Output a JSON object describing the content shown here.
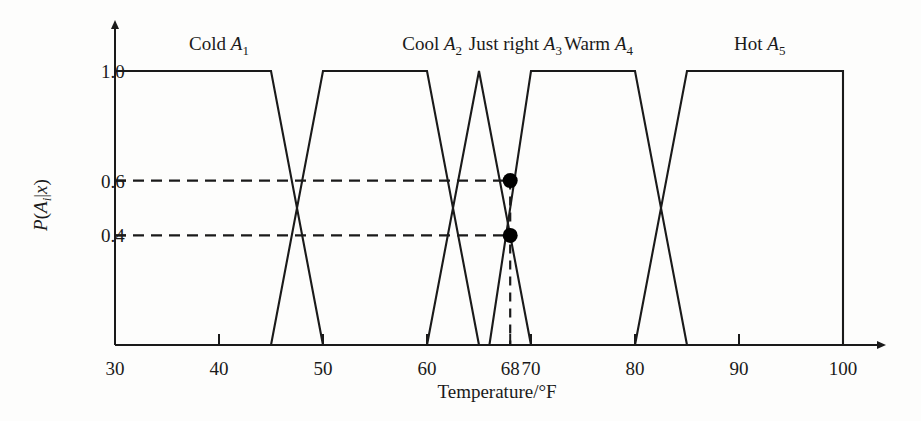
{
  "chart_data": {
    "type": "line",
    "title": "",
    "xlabel": "Temperature/°F",
    "ylabel": "P(A_i|x)",
    "xlim": [
      30,
      100
    ],
    "ylim": [
      0,
      1.0
    ],
    "grid": false,
    "legend_position": "above-curves",
    "x_ticks": [
      {
        "value": 30,
        "label": "30"
      },
      {
        "value": 40,
        "label": "40"
      },
      {
        "value": 50,
        "label": "50"
      },
      {
        "value": 60,
        "label": "60"
      },
      {
        "value": 68,
        "label": "68"
      },
      {
        "value": 70,
        "label": "70"
      },
      {
        "value": 80,
        "label": "80"
      },
      {
        "value": 90,
        "label": "90"
      },
      {
        "value": 100,
        "label": "100"
      }
    ],
    "y_ticks": [
      {
        "value": 1.0,
        "label": "1.0"
      },
      {
        "value": 0.6,
        "label": "0.6"
      },
      {
        "value": 0.4,
        "label": "0.4"
      }
    ],
    "series": [
      {
        "name": "Cold",
        "symbol": "A",
        "subscript": "1",
        "label_text": "Cold",
        "label_x": 40,
        "points": [
          [
            30,
            1.0
          ],
          [
            45,
            1.0
          ],
          [
            50,
            0.0
          ]
        ]
      },
      {
        "name": "Cool",
        "symbol": "A",
        "subscript": "2",
        "label_text": "Cool",
        "label_x": 60.5,
        "points": [
          [
            45,
            0.0
          ],
          [
            50,
            1.0
          ],
          [
            60,
            1.0
          ],
          [
            65,
            0.0
          ]
        ]
      },
      {
        "name": "Just right",
        "symbol": "A",
        "subscript": "3",
        "label_text": "Just right",
        "label_x": 68.5,
        "points": [
          [
            60,
            0.0
          ],
          [
            65,
            1.0
          ],
          [
            70,
            0.0
          ]
        ]
      },
      {
        "name": "Warm",
        "symbol": "A",
        "subscript": "4",
        "label_text": "Warm",
        "label_x": 76.5,
        "points": [
          [
            66,
            0.0
          ],
          [
            70,
            1.0
          ],
          [
            80,
            1.0
          ],
          [
            85,
            0.0
          ]
        ]
      },
      {
        "name": "Hot",
        "symbol": "A",
        "subscript": "5",
        "label_text": "Hot",
        "label_x": 92,
        "points": [
          [
            80,
            0.0
          ],
          [
            85,
            1.0
          ],
          [
            100,
            1.0
          ],
          [
            100,
            0.0
          ]
        ]
      }
    ],
    "annotations": {
      "vertical_marker_x": 68,
      "horizontal_guides": [
        0.6,
        0.4
      ],
      "points": [
        {
          "x": 68,
          "y": 0.6,
          "series": "Just right"
        },
        {
          "x": 68,
          "y": 0.4,
          "series": "Warm"
        }
      ]
    },
    "colors": {
      "curve": "#1a1a1a",
      "axis": "#1a1a1a",
      "guide": "#1a1a1a",
      "marker": "#000000",
      "background": "#fdfdfc"
    }
  }
}
